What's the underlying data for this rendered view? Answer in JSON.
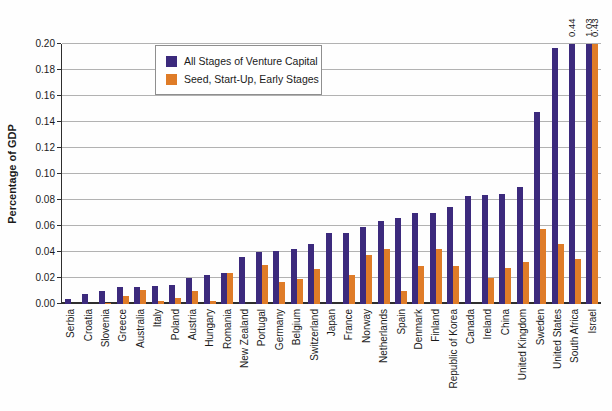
{
  "figure": {
    "y_axis_title": "Percentage of GDP"
  },
  "legend": {
    "items": [
      {
        "label": "All Stages of Venture Capital",
        "color": "#3C2A7D"
      },
      {
        "label": "Seed, Start-Up, Early Stages",
        "color": "#DF7C28"
      }
    ]
  },
  "chart_data": {
    "type": "bar",
    "title": "",
    "xlabel": "",
    "ylabel": "Percentage of GDP",
    "ylim": [
      0,
      0.2
    ],
    "yticks": [
      "0.00",
      "0.02",
      "0.04",
      "0.06",
      "0.08",
      "0.10",
      "0.12",
      "0.14",
      "0.16",
      "0.18",
      "0.20"
    ],
    "grid": true,
    "legend_position": "top-center",
    "bars_clipped_at_ymax": true,
    "categories": [
      "Serbia",
      "Croatia",
      "Slovenia",
      "Greece",
      "Australia",
      "Italy",
      "Poland",
      "Austria",
      "Hungary",
      "Romania",
      "New Zealand",
      "Portugal",
      "Germany",
      "Belgium",
      "Switzerland",
      "Japan",
      "France",
      "Norway",
      "Netherlands",
      "Spain",
      "Denmark",
      "Finland",
      "Republic of Korea",
      "Canada",
      "Ireland",
      "China",
      "United Kingdom",
      "Sweden",
      "United States",
      "South Africa",
      "Israel"
    ],
    "series": [
      {
        "name": "All Stages of Venture Capital",
        "color": "#3C2A7D",
        "values": [
          0.004,
          0.008,
          0.01,
          0.013,
          0.013,
          0.014,
          0.015,
          0.02,
          0.022,
          0.024,
          0.036,
          0.04,
          0.041,
          0.042,
          0.046,
          0.055,
          0.055,
          0.059,
          0.064,
          0.066,
          0.07,
          0.07,
          0.075,
          0.083,
          0.084,
          0.085,
          0.09,
          0.148,
          0.197,
          0.44,
          1.03
        ]
      },
      {
        "name": "Seed, Start-Up, Early Stages",
        "color": "#DF7C28",
        "values": [
          0,
          0,
          0.001,
          0.006,
          0.011,
          0.002,
          0.005,
          0.01,
          0.002,
          0.024,
          0,
          0.03,
          0.017,
          0.019,
          0.027,
          0,
          0.022,
          0.038,
          0.042,
          0.01,
          0.029,
          0.042,
          0.029,
          0,
          0.02,
          0.028,
          0.032,
          0.058,
          0.046,
          0.035,
          0.43
        ]
      }
    ],
    "annotations": [
      {
        "category": "South Africa",
        "series": "All Stages of Venture Capital",
        "text": "0.44"
      },
      {
        "category": "Israel",
        "series": "All Stages of Venture Capital",
        "text": "1.03"
      },
      {
        "category": "Israel",
        "series": "Seed, Start-Up, Early Stages",
        "text": "0.43"
      }
    ]
  }
}
